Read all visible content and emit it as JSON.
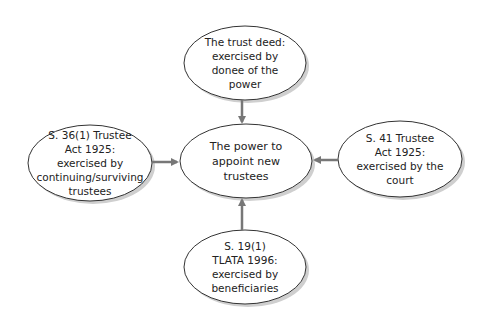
{
  "diagram": {
    "center": {
      "text": "The power to\nappoint new\ntrustees"
    },
    "top": {
      "text": "The trust deed:\nexercised by\ndonee of the\npower"
    },
    "left": {
      "text": "S. 36(1) Trustee\nAct 1925:\nexercised by\ncontinuing/surviving\ntrustees"
    },
    "right": {
      "text": "S. 41 Trustee\nAct 1925:\nexercised by the\ncourt"
    },
    "bottom": {
      "text": "S. 19(1)\nTLATA 1996:\nexercised by\nbeneficiaries"
    },
    "colors": {
      "arrow": "#777777",
      "outline": "#333333",
      "shadow": "#c8c8c8",
      "fill": "#ffffff"
    }
  }
}
